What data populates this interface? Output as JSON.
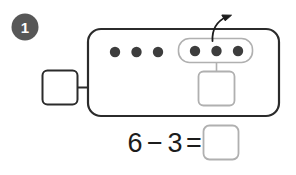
{
  "problem": {
    "number": "1",
    "badge_color": "#575757",
    "badge_text_color": "#ffffff"
  },
  "ten_frame": {
    "outline_color": "#2b2b2b",
    "fill_color": "#ffffff",
    "loose_counters": {
      "count": 3,
      "color": "#3d3d3d",
      "label": "3 counters remaining"
    },
    "grouped_counters": {
      "count": 3,
      "color": "#3d3d3d",
      "group_outline_color": "#b0b0b0",
      "label": "3 counters grouped to take away"
    },
    "total_counters": 6
  },
  "arrow": {
    "color": "#1c1c1c",
    "label": "take away arrow"
  },
  "answer_boxes": {
    "left_box": {
      "value": "",
      "placeholder": "",
      "border_color": "#2b2b2b",
      "label": "total box"
    },
    "subtrahend_box": {
      "value": "",
      "placeholder": "",
      "border_color": "#b0b0b0",
      "label": "taken away box"
    },
    "result_box": {
      "value": "",
      "placeholder": "",
      "border_color": "#b0b0b0",
      "label": "difference box"
    }
  },
  "equation": {
    "minuend": "6",
    "operator": "−",
    "subtrahend": "3",
    "equals": "=",
    "answer": "",
    "full_text": "6 − 3 ="
  }
}
